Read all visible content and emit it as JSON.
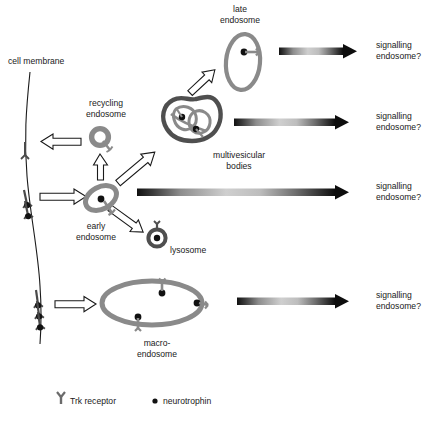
{
  "figure": {
    "title_text": "",
    "type": "cell-biology-schematic",
    "background_color": "#ffffff",
    "ink_color": "#1a1a1a",
    "organelle_gray": "#808080",
    "organelle_dark_gray": "#5a5a5a"
  },
  "labels": {
    "cell_membrane": "cell membrane",
    "recycling_endosome": "recycling\nendosome",
    "recycling_endosome_line1": "recycling",
    "recycling_endosome_line2": "endosome",
    "early_endosome_line1": "early",
    "early_endosome_line2": "endosome",
    "late_endosome_line1": "late",
    "late_endosome_line2": "endosome",
    "multivesicular_line1": "multivesicular",
    "multivesicular_line2": "bodies",
    "lysosome": "lysosome",
    "macro_endosome_line1": "macro-",
    "macro_endosome_line2": "endosome",
    "signalling_endosome_line1": "signalling",
    "signalling_endosome_line2": "endosome?"
  },
  "signalling_outputs": [
    {
      "id": "from-late-endosome",
      "line1": "signalling",
      "line2": "endosome?"
    },
    {
      "id": "from-multivesicular-bodies",
      "line1": "signalling",
      "line2": "endosome?"
    },
    {
      "id": "from-early-endosome",
      "line1": "signalling",
      "line2": "endosome?"
    },
    {
      "id": "from-macro-endosome",
      "line1": "signalling",
      "line2": "endosome?"
    }
  ],
  "legend": {
    "items": [
      {
        "icon": "trk-receptor-icon",
        "label": "Trk receptor"
      },
      {
        "icon": "neurotrophin-dot-icon",
        "label": "neurotrophin"
      }
    ]
  },
  "organelles": [
    {
      "id": "recycling-endosome",
      "shape": "small-circle-with-receptor",
      "receptors": 1,
      "neurotrophins": 0
    },
    {
      "id": "early-endosome",
      "shape": "tilted-ellipse-with-receptor",
      "receptors": 1,
      "neurotrophins": 1
    },
    {
      "id": "late-endosome",
      "shape": "vertical-ellipse-with-receptor",
      "receptors": 1,
      "neurotrophins": 1
    },
    {
      "id": "multivesicular-bodies",
      "shape": "irregular-blob-with-internal-vesicles",
      "receptors": 2,
      "neurotrophins": 2
    },
    {
      "id": "lysosome",
      "shape": "ring-with-dot",
      "receptors": 1,
      "neurotrophins": 1
    },
    {
      "id": "macro-endosome",
      "shape": "large-ellipse-with-receptors",
      "receptors": 3,
      "neurotrophins": 3
    }
  ],
  "membrane_receptor_groups": [
    {
      "id": "recycled-receptor-top",
      "count": 1,
      "ligand_bound": false
    },
    {
      "id": "bound-receptors-middle",
      "count": 2,
      "ligand_bound": true
    },
    {
      "id": "bound-receptors-bottom",
      "count": 3,
      "ligand_bound": true
    }
  ],
  "transport_arrows": [
    {
      "id": "arrow-late-endosome-transport",
      "style": "gradient-filled",
      "direction": "right"
    },
    {
      "id": "arrow-multivesicular-transport",
      "style": "gradient-filled",
      "direction": "right"
    },
    {
      "id": "arrow-early-endosome-transport",
      "style": "gradient-filled",
      "direction": "right"
    },
    {
      "id": "arrow-macro-endosome-transport",
      "style": "gradient-filled",
      "direction": "right"
    }
  ],
  "process_arrows": [
    {
      "id": "arrow-recycle-to-membrane",
      "style": "outline",
      "direction": "left"
    },
    {
      "id": "arrow-endocytosis-middle",
      "style": "outline",
      "direction": "right"
    },
    {
      "id": "arrow-endosome-to-recycling",
      "style": "outline",
      "direction": "up"
    },
    {
      "id": "arrow-endosome-to-multivesicular",
      "style": "outline",
      "direction": "up-right"
    },
    {
      "id": "arrow-multivesicular-to-late",
      "style": "outline",
      "direction": "up-right"
    },
    {
      "id": "arrow-endosome-to-lysosome",
      "style": "outline",
      "direction": "down-right"
    },
    {
      "id": "arrow-macropinocytosis",
      "style": "outline",
      "direction": "right"
    }
  ]
}
